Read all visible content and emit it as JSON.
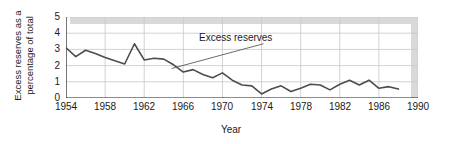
{
  "chart_data": {
    "type": "line",
    "title": "",
    "xlabel": "Year",
    "ylabel": "Excess reserves as a percentage of total",
    "ylabel_lines": [
      "Excess reserves as a",
      "percentage of total"
    ],
    "xlim": [
      1954,
      1990
    ],
    "ylim": [
      0,
      5
    ],
    "xticks": [
      1954,
      1958,
      1962,
      1966,
      1970,
      1974,
      1978,
      1982,
      1986,
      1990
    ],
    "yticks": [
      0,
      1,
      2,
      3,
      4,
      5
    ],
    "grid": "both",
    "legend_position": "none",
    "annotations": [
      {
        "text": "Excess reserves",
        "text_x": 1974.5,
        "text_y": 3.55,
        "leader_from": [
          1974.2,
          3.35
        ],
        "leader_to": [
          1964.8,
          1.82
        ]
      }
    ],
    "series": [
      {
        "name": "Excess reserves",
        "color": "#4d4d4d",
        "x": [
          1954,
          1955,
          1956,
          1957,
          1958,
          1959,
          1960,
          1961,
          1962,
          1963,
          1964,
          1965,
          1966,
          1967,
          1968,
          1969,
          1970,
          1971,
          1972,
          1973,
          1974,
          1975,
          1976,
          1977,
          1978,
          1979,
          1980,
          1981,
          1982,
          1983,
          1984,
          1985,
          1986,
          1987,
          1988
        ],
        "values": [
          3.1,
          2.55,
          2.95,
          2.75,
          2.5,
          2.3,
          2.1,
          3.35,
          2.35,
          2.45,
          2.4,
          2.05,
          1.6,
          1.75,
          1.45,
          1.25,
          1.55,
          1.1,
          0.8,
          0.75,
          0.25,
          0.55,
          0.75,
          0.4,
          0.6,
          0.85,
          0.8,
          0.5,
          0.85,
          1.1,
          0.8,
          1.1,
          0.6,
          0.7,
          0.55
        ]
      }
    ]
  },
  "styling": {
    "line_color": "#4d4d4d",
    "grid_color": "#c8c8c8",
    "axis_color": "#1a1a1a",
    "shadow_color": "#d9d9d9",
    "background": "#ffffff"
  }
}
